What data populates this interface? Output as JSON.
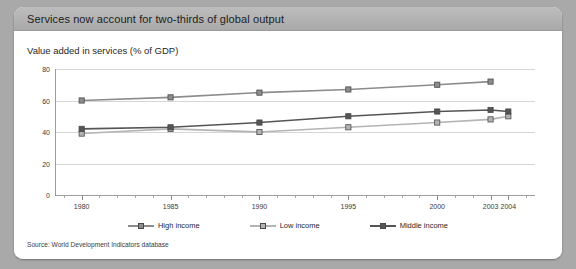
{
  "panel": {
    "title": "Services now account for two-thirds of global output",
    "subtitle": "Value added in services (% of GDP)",
    "source": "Source: World Development Indicators database"
  },
  "colors": {
    "panel_background": "#a9a9a9",
    "titlebar": "#b2b2b2",
    "body": "#ffffff",
    "gridline": "#d6d6d6",
    "axis": "#9e9e9e",
    "high_income": "#8c8c8c",
    "low_income": "#b4b4b4",
    "middle_income": "#555555"
  },
  "chart_data": {
    "type": "line",
    "title": "Services now account for two-thirds of global output",
    "subtitle": "Value added in services (% of GDP)",
    "xlabel": "",
    "ylabel": "",
    "ylim": [
      0,
      80
    ],
    "yticks": [
      0,
      20,
      40,
      60,
      80
    ],
    "grid": true,
    "legend_position": "bottom",
    "x": [
      1980,
      1985,
      1990,
      1995,
      2000,
      2003,
      2004
    ],
    "categories": [
      "1980",
      "1985",
      "1990",
      "1995",
      "2000",
      "2003",
      "2004"
    ],
    "series": [
      {
        "name": "High income",
        "color": "#8c8c8c",
        "values": [
          60,
          62,
          65,
          67,
          70,
          72,
          null
        ]
      },
      {
        "name": "Low income",
        "color": "#b4b4b4",
        "values": [
          39,
          42,
          40,
          43,
          46,
          48,
          50
        ]
      },
      {
        "name": "Middle income",
        "color": "#555555",
        "values": [
          42,
          43,
          46,
          50,
          53,
          54,
          53
        ]
      }
    ],
    "source": "Source: World Development Indicators database"
  },
  "legend": [
    {
      "label": "High income"
    },
    {
      "label": "Low income"
    },
    {
      "label": "Middle income"
    }
  ]
}
